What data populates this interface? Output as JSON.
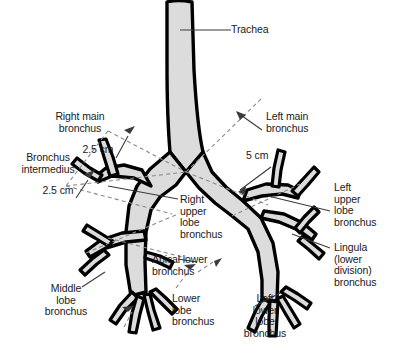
{
  "figure": {
    "background_color": "#ffffff",
    "airway_fill_color": "#dcdcdc",
    "airway_outline_color": "#000000",
    "leader_line_color": "#3a3a3a",
    "dashed_line_color": "#8a8a8a"
  },
  "labels": {
    "trachea": "Trachea",
    "right_main_bronchus": "Right main\nbronchus",
    "bronchus_intermedius": "Bronchus\nintermedius",
    "left_main_bronchus": "Left main\nbronchus",
    "right_upper_lobe_bronchus": "Right\nupper\nlobe\nbronchus",
    "left_upper_lobe_bronchus": "Left\nupper\nlobe\nbronchus",
    "lingula_bronchus": "Lingula\n(lower\ndivision)\nbronchus",
    "apical_lower_bronchus": "Apical lower\nbronchus",
    "middle_lobe_bronchus": "Middle\nlobe\nbronchus",
    "lower_lobe_bronchus": "Lower\nlobe\nbronchus",
    "left_lower_lobe_bronchus": "Left\nlower\nlobe\nbronchus"
  },
  "measurements": {
    "right_main_length": "2.5 cm",
    "bronchus_intermedius_length": "2.5 cm",
    "left_main_length": "5 cm"
  }
}
